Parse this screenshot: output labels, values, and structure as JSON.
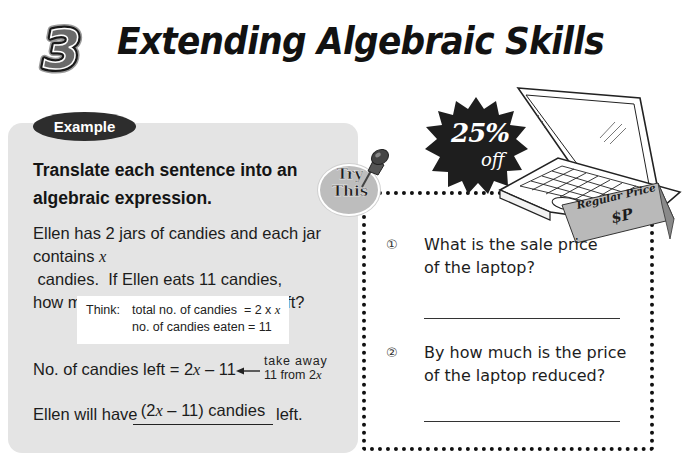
{
  "header": {
    "chapter_number": "3",
    "title": "Extending Algebraic Skills"
  },
  "example": {
    "badge_label": "Example",
    "instruction": "Translate each sentence into an algebraic expression.",
    "problem": {
      "line1": "Ellen has 2 jars of candies and each jar",
      "line2_pre": "contains ",
      "line2_var": "x",
      "line2_post": " candies.  If Ellen eats 11 candies,",
      "line3": "how many candies will she have left?"
    },
    "think": {
      "label": "Think:",
      "line1_text": "total no. of candies  = 2 x ",
      "line1_var": "x",
      "line2_text": "no. of candies eaten = 11"
    },
    "result": {
      "pre": "No. of candies left = 2",
      "var": "x",
      "post": " – 11"
    },
    "note": {
      "line1": "take away",
      "line2_pre": "11 from 2",
      "line2_var": "x"
    },
    "answer": {
      "pre": "Ellen will have",
      "blank_pre": "(2",
      "blank_var": "x",
      "blank_post": " – 11) candies",
      "post": "left."
    }
  },
  "try_this": {
    "badge_line1": "Try",
    "badge_line2": "This",
    "illustration": {
      "discount_percent": "25%",
      "discount_word": "off",
      "tag_label": "Regular Price",
      "tag_value": "$P"
    },
    "questions": [
      {
        "number": "①",
        "line1": "What is the sale price",
        "line2": "of the laptop?",
        "answer": ""
      },
      {
        "number": "②",
        "line1": "By how much is the price",
        "line2": "of the laptop reduced?",
        "answer": ""
      }
    ]
  },
  "colors": {
    "panel_gray": "#e4e4e4",
    "badge_dark": "#2d2d2d",
    "try_badge_gray": "#bdbdbd",
    "text": "#1c1c1c"
  }
}
